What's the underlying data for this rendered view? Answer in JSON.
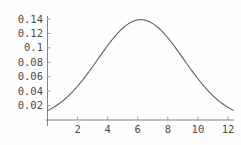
{
  "chart_data": {
    "type": "line",
    "title": "",
    "subtitle": "",
    "xlabel": "",
    "ylabel": "",
    "xlim": [
      0,
      12.6
    ],
    "ylim": [
      0,
      0.148
    ],
    "grid": false,
    "legend": null,
    "annotations": [],
    "x_ticks": [
      2,
      4,
      6,
      8,
      10,
      12
    ],
    "x_tick_labels": [
      "2",
      "4",
      "6",
      "8",
      "10",
      "12"
    ],
    "y_ticks": [
      0.02,
      0.04,
      0.06,
      0.08,
      0.1,
      0.12,
      0.14
    ],
    "y_tick_labels": [
      "0.02",
      "0.04",
      "0.06",
      "0.08",
      "0.1",
      "0.12",
      "0.14"
    ],
    "series": [
      {
        "name": "density",
        "color": "#5a5a5a",
        "x": [
          0,
          0.3,
          0.6,
          0.9,
          1.2,
          1.5,
          1.8,
          2.1,
          2.4,
          2.7,
          3,
          3.3,
          3.6,
          3.9,
          4.2,
          4.5,
          4.8,
          5.1,
          5.4,
          5.7,
          6,
          6.2,
          6.5,
          6.8,
          7.1,
          7.4,
          7.7,
          8,
          8.3,
          8.6,
          8.9,
          9.2,
          9.5,
          9.8,
          10.1,
          10.4,
          10.7,
          11,
          11.3,
          11.6,
          11.9,
          12.2
        ],
        "y": [
          0.0195,
          0.0222,
          0.0253,
          0.0288,
          0.0327,
          0.0371,
          0.0419,
          0.0471,
          0.0527,
          0.0587,
          0.0649,
          0.0713,
          0.0779,
          0.0844,
          0.0909,
          0.0971,
          0.1029,
          0.1082,
          0.1129,
          0.1168,
          0.1196,
          0.1387,
          0.1382,
          0.1367,
          0.1341,
          0.1304,
          0.1257,
          0.1201,
          0.1138,
          0.1068,
          0.0994,
          0.0917,
          0.0839,
          0.0761,
          0.0685,
          0.0612,
          0.0543,
          0.0478,
          0.0419,
          0.0365,
          0.0316,
          0.0272
        ]
      }
    ],
    "curve_model": {
      "kind": "gaussian",
      "peak_x": 6.2,
      "peak_y": 0.139,
      "sigma": 2.85,
      "left_edge_y": 0.0195,
      "right_edge_y": 0.018
    }
  },
  "axes": {
    "x_axis_name": "x-axis",
    "y_axis_name": "y-axis"
  },
  "colors": {
    "background": "#fefefe",
    "curve": "#5a5a5a",
    "axis": "#777777",
    "tick": "#888888",
    "label_text": "#4a4a4a"
  }
}
